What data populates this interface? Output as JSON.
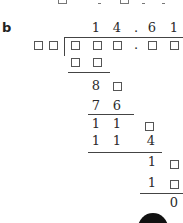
{
  "part_label": "b",
  "top_partial_row": [
    "□",
    "1",
    "□",
    "3",
    "1"
  ],
  "quotient": [
    "1",
    "4",
    ".",
    "6",
    "1"
  ],
  "divisor": [
    "□",
    "□"
  ],
  "dividend": [
    "□",
    "□",
    "□",
    ".",
    "□",
    "□"
  ],
  "steps": [
    {
      "cells": [
        "□",
        "□"
      ],
      "role": "subtract",
      "underline": true
    },
    {
      "cells": [
        "8",
        "□"
      ],
      "role": "remainder"
    },
    {
      "cells": [
        "7",
        "6"
      ],
      "role": "subtract",
      "underline": true
    },
    {
      "cells": [
        "1",
        "1",
        "□"
      ],
      "role": "remainder"
    },
    {
      "cells": [
        "1",
        "1",
        "4"
      ],
      "role": "subtract",
      "underline": true
    },
    {
      "cells": [
        "1",
        "□"
      ],
      "role": "remainder"
    },
    {
      "cells": [
        "1",
        "□"
      ],
      "role": "subtract",
      "underline": true
    },
    {
      "cells": [
        "0"
      ],
      "role": "final-remainder"
    }
  ],
  "final_remainder": "0",
  "placeholder_symbol": "□",
  "colors": {
    "text": "#2a2a2a",
    "line": "#444444",
    "badge": "#111111"
  }
}
